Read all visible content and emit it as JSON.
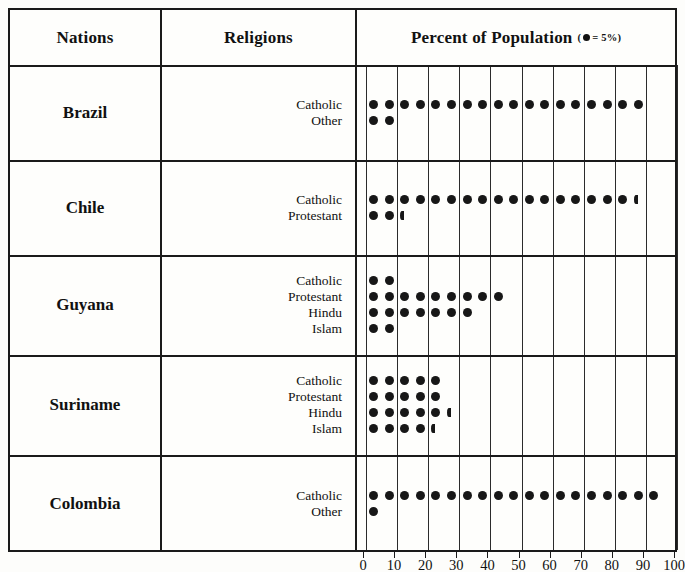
{
  "header": {
    "nations": "Nations",
    "religions": "Religions",
    "percent": "Percent of Population",
    "legend_prefix": "(",
    "legend_text": "= 5%)",
    "legend_icon": "filled-circle-icon"
  },
  "colors": {
    "dot": "#171717",
    "border": "#1a1a1a",
    "background": "#fdfdfb"
  },
  "axis": {
    "labels": [
      "0",
      "10",
      "20",
      "30",
      "40",
      "50",
      "60",
      "70",
      "80",
      "90",
      "100"
    ],
    "min": 0,
    "max": 100,
    "step": 10,
    "dot_value": 5
  },
  "chart_data": {
    "type": "table",
    "title": "Percent of Population",
    "subtitle": "(● = 5%)",
    "xlabel": "",
    "ylabel": "",
    "xlim": [
      0,
      100
    ],
    "grid": true,
    "legend": "one dot = 5%",
    "columns": [
      "Nations",
      "Religions",
      "Percent of Population"
    ],
    "rows": [
      {
        "nation": "Brazil",
        "religions": [
          {
            "label": "Catholic",
            "percent": 90,
            "dots": 18,
            "half": false
          },
          {
            "label": "Other",
            "percent": 10,
            "dots": 2,
            "half": false
          }
        ]
      },
      {
        "nation": "Chile",
        "religions": [
          {
            "label": "Catholic",
            "percent": 87.5,
            "dots": 17,
            "half": true
          },
          {
            "label": "Protestant",
            "percent": 12.5,
            "dots": 2,
            "half": true
          }
        ]
      },
      {
        "nation": "Guyana",
        "religions": [
          {
            "label": "Catholic",
            "percent": 10,
            "dots": 2,
            "half": false
          },
          {
            "label": "Protestant",
            "percent": 45,
            "dots": 9,
            "half": false
          },
          {
            "label": "Hindu",
            "percent": 35,
            "dots": 7,
            "half": false
          },
          {
            "label": "Islam",
            "percent": 10,
            "dots": 2,
            "half": false
          }
        ]
      },
      {
        "nation": "Suriname",
        "religions": [
          {
            "label": "Catholic",
            "percent": 25,
            "dots": 5,
            "half": false
          },
          {
            "label": "Protestant",
            "percent": 25,
            "dots": 5,
            "half": false
          },
          {
            "label": "Hindu",
            "percent": 27.5,
            "dots": 5,
            "half": true
          },
          {
            "label": "Islam",
            "percent": 22.5,
            "dots": 4,
            "half": true
          }
        ]
      },
      {
        "nation": "Colombia",
        "religions": [
          {
            "label": "Catholic",
            "percent": 95,
            "dots": 19,
            "half": false
          },
          {
            "label": "Other",
            "percent": 5,
            "dots": 1,
            "half": false
          }
        ]
      }
    ]
  }
}
